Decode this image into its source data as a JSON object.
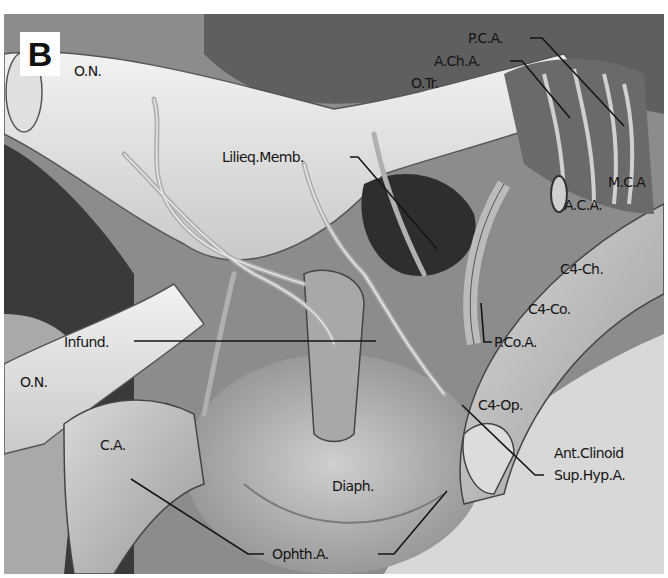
{
  "figure": {
    "panel_letter": "B",
    "colors": {
      "background": "#7a7a7a",
      "nerve": "#e6e6e6",
      "vessel": "#b8b8b8",
      "dark_cavity": "#2a2a2a",
      "label_text": "#151515",
      "leader_line": "#151515"
    },
    "labels": {
      "on_top": "O.N.",
      "on_bottom": "O.N.",
      "otr": "O.Tr.",
      "pca": "P.C.A.",
      "acha": "A.Ch.A.",
      "mca": "M.C.A",
      "aca": "A.C.A.",
      "lilieq": "Lilieq.Memb.",
      "c4ch": "C4-Ch.",
      "c4co": "C4-Co.",
      "pcoa": "P.Co.A.",
      "infund": "Infund.",
      "c4op": "C4-Op.",
      "ca": "C.A.",
      "antclinoid": "Ant.Clinoid",
      "suphyp": "Sup.Hyp.A.",
      "diaph": "Diaph.",
      "ophth": "Ophth.A."
    }
  }
}
